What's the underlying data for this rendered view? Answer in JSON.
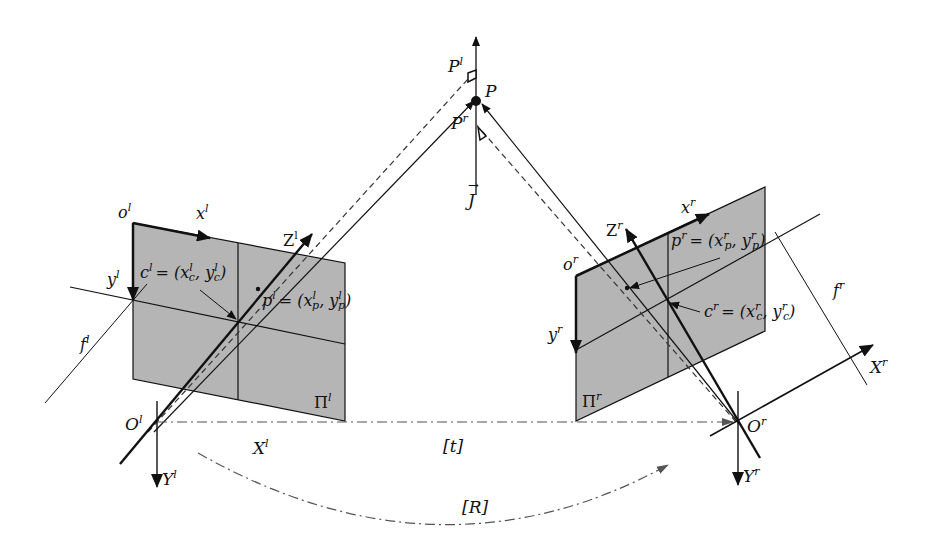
{
  "diagram": {
    "type": "stereo-camera-geometry",
    "colors": {
      "plane_fill": "#b5b5b5",
      "line": "#111111",
      "dashed": "#333333",
      "background": "#ffffff"
    },
    "point": {
      "name": "P",
      "left_proj": "P",
      "left_proj_sup": "l",
      "right_proj": "P",
      "right_proj_sup": "r",
      "axis": "J",
      "axis_vec": "→"
    },
    "left_camera": {
      "image_origin": "o",
      "image_origin_sup": "l",
      "x_axis": "x",
      "x_axis_sup": "l",
      "y_axis": "y",
      "y_axis_sup": "l",
      "principal_point": "c",
      "principal_point_sup": "l",
      "principal_eq": "= (x",
      "principal_x_sub": "c",
      "principal_x_sup": "l",
      "principal_sep": ", y",
      "principal_y_sub": "c",
      "principal_y_sup": "l",
      "close": ")",
      "projection": "p",
      "projection_sup": "l",
      "projection_eq": "= (x",
      "projection_x_sub": "p",
      "projection_x_sup": "l",
      "projection_sep": ", y",
      "projection_y_sub": "p",
      "projection_y_sup": "l",
      "z_axis": "Z",
      "z_axis_sup": "l",
      "focal": "f",
      "focal_sup": "l",
      "plane": "Π",
      "plane_sup": "l",
      "center": "O",
      "center_sup": "l",
      "X_axis": "X",
      "X_axis_sup": "l",
      "Y_axis": "Y",
      "Y_axis_sup": "l"
    },
    "right_camera": {
      "image_origin": "o",
      "image_origin_sup": "r",
      "x_axis": "x",
      "x_axis_sup": "r",
      "y_axis": "y",
      "y_axis_sup": "r",
      "principal_point": "c",
      "principal_point_sup": "r",
      "principal_eq": "= (x",
      "principal_x_sub": "c",
      "principal_x_sup": "r",
      "principal_sep": ", y",
      "principal_y_sub": "c",
      "principal_y_sup": "r",
      "projection": "p",
      "projection_sup": "r",
      "projection_eq": "= (x",
      "projection_x_sub": "p",
      "projection_x_sup": "r",
      "projection_sep": ", y",
      "projection_y_sub": "p",
      "projection_y_sup": "r",
      "z_axis": "Z",
      "z_axis_sup": "r",
      "focal": "f",
      "focal_sup": "r",
      "plane": "Π",
      "plane_sup": "r",
      "center": "O",
      "center_sup": "r",
      "X_axis": "X",
      "X_axis_sup": "r",
      "Y_axis": "Y",
      "Y_axis_sup": "r"
    },
    "translation": "[t]",
    "rotation": "[R]"
  }
}
